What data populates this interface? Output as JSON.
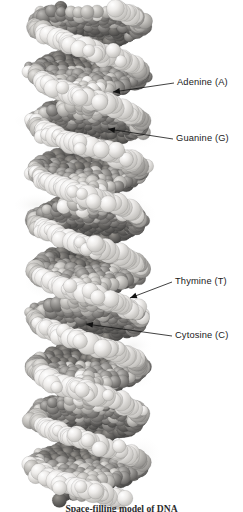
{
  "figure": {
    "rendering": "space-filling (CPK) model, grayscale",
    "background_color": "#ffffff",
    "caption": "Space-filling model of DNA"
  },
  "callouts": [
    {
      "id": "adenine",
      "label": "Adenine (A)",
      "base_code": "A",
      "base_name": "Adenine",
      "text_x": 177,
      "text_y": 85,
      "leader_start_x": 174,
      "leader_start_y": 83,
      "leader_end_x": 113,
      "leader_end_y": 92,
      "arrow": true
    },
    {
      "id": "guanine",
      "label": "Guanine (G)",
      "base_code": "G",
      "base_name": "Guanine",
      "text_x": 176,
      "text_y": 141,
      "leader_start_x": 173,
      "leader_start_y": 139,
      "leader_end_x": 108,
      "leader_end_y": 129,
      "arrow": true
    },
    {
      "id": "thymine",
      "label": "Thymine (T)",
      "base_code": "T",
      "base_name": "Thymine",
      "text_x": 175,
      "text_y": 284,
      "leader_start_x": 172,
      "leader_start_y": 282,
      "leader_end_x": 130,
      "leader_end_y": 298,
      "arrow": true
    },
    {
      "id": "cytosine",
      "label": "Cytosine (C)",
      "base_code": "C",
      "base_name": "Cytosine",
      "text_x": 175,
      "text_y": 338,
      "leader_start_x": 172,
      "leader_start_y": 336,
      "leader_end_x": 86,
      "leader_end_y": 324,
      "arrow": true
    }
  ],
  "colors": {
    "leader_line": "#111111",
    "label_text": "#1a1a1a",
    "caption_text": "#2b2b2b",
    "atom_light": "#ededeb",
    "atom_mid": "#b8b6b2",
    "atom_dark": "#7c7a77",
    "atom_darkest": "#575553",
    "shadow": "#d7d6d4"
  },
  "molecule": {
    "strand_count": 2,
    "helix_turns": 5,
    "axis_x": 88,
    "top_y": 8,
    "bottom_y": 500,
    "helix_radius_x": 52,
    "turn_height": 98
  }
}
